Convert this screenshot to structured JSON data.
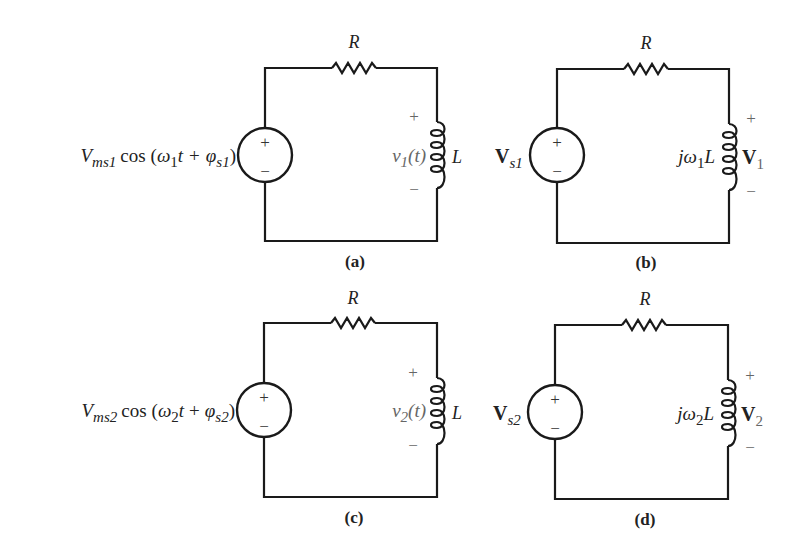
{
  "figure": {
    "panels": [
      {
        "id": "a",
        "caption": "(a)",
        "domain": "time",
        "resistor_label": "R",
        "inductor_label": "L",
        "source": {
          "type": "sinusoidal-voltage",
          "amplitude": "V",
          "amplitude_sub": "ms1",
          "func": "cos",
          "open": "(",
          "omega": "ω",
          "omega_sub": "1",
          "t": "t",
          "plus": "+",
          "phi": "φ",
          "phi_sub": "s1",
          "close": ")",
          "plus_sign": "+",
          "minus_sign": "−"
        },
        "output": {
          "name": "v",
          "sub": "1",
          "arg": "(t)",
          "plus": "+",
          "minus": "−"
        }
      },
      {
        "id": "b",
        "caption": "(b)",
        "domain": "phasor",
        "resistor_label": "R",
        "inductor_label": {
          "j": "j",
          "omega": "ω",
          "sub": "1",
          "L": "L"
        },
        "source": {
          "type": "phasor-voltage",
          "name": "V",
          "sub": "s1",
          "plus_sign": "+",
          "minus_sign": "−"
        },
        "output": {
          "name": "V",
          "sub": "1",
          "plus": "+",
          "minus": "−"
        }
      },
      {
        "id": "c",
        "caption": "(c)",
        "domain": "time",
        "resistor_label": "R",
        "inductor_label": "L",
        "source": {
          "type": "sinusoidal-voltage",
          "amplitude": "V",
          "amplitude_sub": "ms2",
          "func": "cos",
          "open": "(",
          "omega": "ω",
          "omega_sub": "2",
          "t": "t",
          "plus": "+",
          "phi": "φ",
          "phi_sub": "s2",
          "close": ")",
          "plus_sign": "+",
          "minus_sign": "−"
        },
        "output": {
          "name": "v",
          "sub": "2",
          "arg": "(t)",
          "plus": "+",
          "minus": "−"
        }
      },
      {
        "id": "d",
        "caption": "(d)",
        "domain": "phasor",
        "resistor_label": "R",
        "inductor_label": {
          "j": "j",
          "omega": "ω",
          "sub": "2",
          "L": "L"
        },
        "source": {
          "type": "phasor-voltage",
          "name": "V",
          "sub": "s2",
          "plus_sign": "+",
          "minus_sign": "−"
        },
        "output": {
          "name": "V",
          "sub": "2",
          "plus": "+",
          "minus": "−"
        }
      }
    ]
  }
}
